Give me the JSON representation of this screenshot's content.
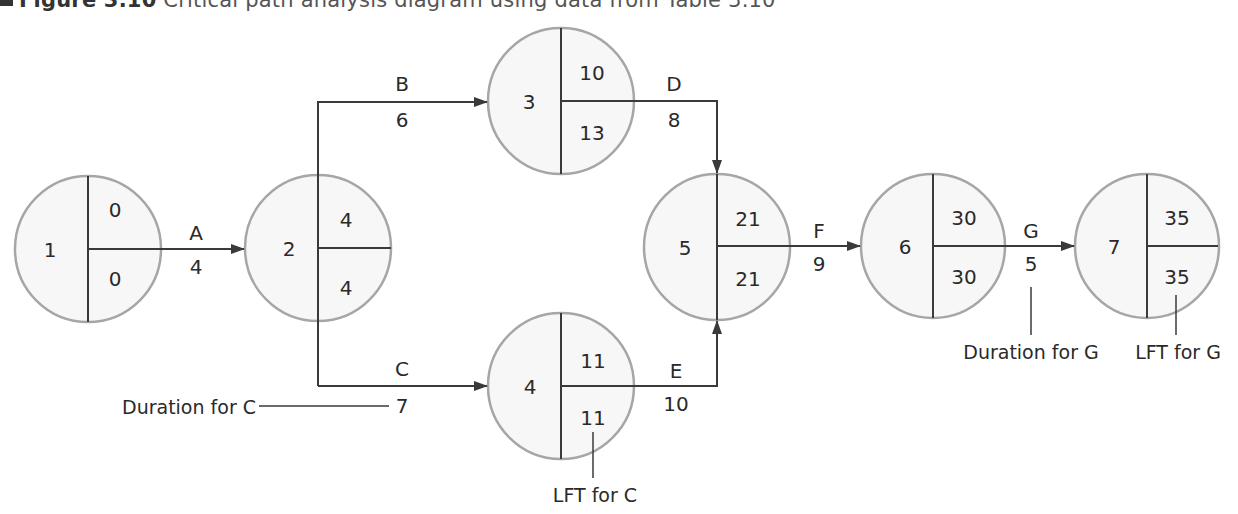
{
  "title": {
    "figure_label": "Figure 3.10",
    "caption": "Critical path analysis diagram using data from Table 3.10"
  },
  "colors": {
    "node_fill": "#f7f7f7",
    "node_stroke": "#a6a6a6",
    "line": "#3a3a3a",
    "text": "#2a2a2a"
  },
  "nodes": [
    {
      "id": "1",
      "est": "0",
      "lft": "0"
    },
    {
      "id": "2",
      "est": "4",
      "lft": "4"
    },
    {
      "id": "3",
      "est": "10",
      "lft": "13"
    },
    {
      "id": "4",
      "est": "11",
      "lft": "11"
    },
    {
      "id": "5",
      "est": "21",
      "lft": "21"
    },
    {
      "id": "6",
      "est": "30",
      "lft": "30"
    },
    {
      "id": "7",
      "est": "35",
      "lft": "35"
    }
  ],
  "activities": [
    {
      "name": "A",
      "duration": "4",
      "from": "1",
      "to": "2"
    },
    {
      "name": "B",
      "duration": "6",
      "from": "2",
      "to": "3"
    },
    {
      "name": "C",
      "duration": "7",
      "from": "2",
      "to": "4"
    },
    {
      "name": "D",
      "duration": "8",
      "from": "3",
      "to": "5"
    },
    {
      "name": "E",
      "duration": "10",
      "from": "4",
      "to": "5"
    },
    {
      "name": "F",
      "duration": "9",
      "from": "5",
      "to": "6"
    },
    {
      "name": "G",
      "duration": "5",
      "from": "6",
      "to": "7"
    }
  ],
  "annotations": {
    "duration_c": "Duration for C",
    "lft_c": "LFT for C",
    "duration_g": "Duration for G",
    "lft_g": "LFT for G"
  }
}
